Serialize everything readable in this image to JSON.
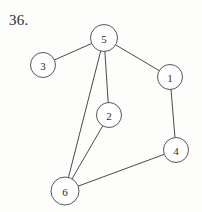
{
  "figure": {
    "problem_number": "36.",
    "width": 202,
    "height": 212,
    "background_color": "#fdfdfc",
    "stroke_color": "#4a4a4a",
    "node_fill_color": "#ffffff",
    "node_stroke_color": "#575757",
    "label_color": "#2b2b2b"
  },
  "chart_data": {
    "type": "diagram",
    "diagram_kind": "undirected-graph",
    "title": "36.",
    "node_count": 6,
    "edge_count": 7,
    "nodes": [
      {
        "id": "1",
        "label": "1",
        "cx": 170,
        "cy": 77,
        "r": 12.5
      },
      {
        "id": "2",
        "label": "2",
        "cx": 109,
        "cy": 115,
        "r": 12.5
      },
      {
        "id": "3",
        "label": "3",
        "cx": 43,
        "cy": 65,
        "r": 12.5
      },
      {
        "id": "4",
        "label": "4",
        "cx": 176,
        "cy": 150,
        "r": 12.5
      },
      {
        "id": "5",
        "label": "5",
        "cx": 104,
        "cy": 38,
        "r": 13.5
      },
      {
        "id": "6",
        "label": "6",
        "cx": 65,
        "cy": 191,
        "r": 14.0
      }
    ],
    "edges": [
      {
        "source": "5",
        "target": "3"
      },
      {
        "source": "5",
        "target": "1"
      },
      {
        "source": "5",
        "target": "2"
      },
      {
        "source": "5",
        "target": "6"
      },
      {
        "source": "2",
        "target": "6"
      },
      {
        "source": "1",
        "target": "4"
      },
      {
        "source": "4",
        "target": "6"
      }
    ],
    "adjacency": {
      "1": [
        "5",
        "4"
      ],
      "2": [
        "5",
        "6"
      ],
      "3": [
        "5"
      ],
      "4": [
        "1",
        "6"
      ],
      "5": [
        "3",
        "1",
        "2",
        "6"
      ],
      "6": [
        "5",
        "2",
        "4"
      ]
    },
    "degrees": {
      "1": 2,
      "2": 2,
      "3": 1,
      "4": 2,
      "5": 4,
      "6": 3
    }
  }
}
